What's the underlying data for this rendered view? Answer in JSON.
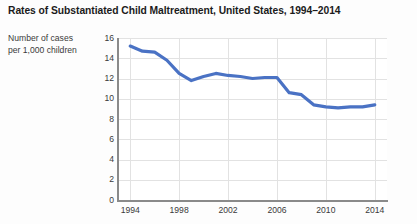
{
  "chart_data": {
    "type": "line",
    "title": "Rates of Substantiated Child Maltreatment, United States, 1994–2014",
    "ylabel": "Number of cases\nper 1,000 children",
    "ylabel_line1": "Number of cases",
    "ylabel_line2": "per 1,000 children",
    "xlabel": "",
    "ylim": [
      0,
      16
    ],
    "xlim": [
      1993,
      2015
    ],
    "yticks": [
      0,
      2,
      4,
      6,
      8,
      10,
      12,
      14,
      16
    ],
    "ytick_labels": [
      "0",
      "2",
      "4",
      "6",
      "8",
      "10",
      "12",
      "14",
      "16"
    ],
    "xticks": [
      1994,
      1998,
      2002,
      2006,
      2010,
      2014
    ],
    "xtick_labels": [
      "1994",
      "1998",
      "2002",
      "2006",
      "2010",
      "2014"
    ],
    "grid": true,
    "legend": false,
    "line_color": "#4a72c4",
    "line_width": 3.2,
    "x": [
      1994,
      1995,
      1996,
      1997,
      1998,
      1999,
      2000,
      2001,
      2002,
      2003,
      2004,
      2005,
      2006,
      2007,
      2008,
      2009,
      2010,
      2011,
      2012,
      2013,
      2014
    ],
    "values": [
      15.2,
      14.7,
      14.6,
      13.8,
      12.5,
      11.8,
      12.2,
      12.5,
      12.3,
      12.2,
      12.0,
      12.1,
      12.1,
      10.6,
      10.4,
      9.4,
      9.2,
      9.1,
      9.2,
      9.2,
      9.4
    ],
    "series": [
      {
        "name": "Substantiated child maltreatment rate",
        "values": [
          15.2,
          14.7,
          14.6,
          13.8,
          12.5,
          11.8,
          12.2,
          12.5,
          12.3,
          12.2,
          12.0,
          12.1,
          12.1,
          10.6,
          10.4,
          9.4,
          9.2,
          9.1,
          9.2,
          9.2,
          9.4
        ]
      }
    ]
  }
}
